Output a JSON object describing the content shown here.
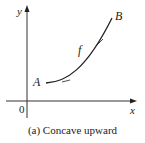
{
  "figure": {
    "caption": "(a) Concave upward",
    "axes": {
      "x_label": "x",
      "y_label": "y",
      "origin_label": "0"
    },
    "curve": {
      "name": "f",
      "start_point_label": "A",
      "end_point_label": "B",
      "concavity": "upward"
    },
    "colors": {
      "stroke": "#222222",
      "background": "#ffffff"
    }
  }
}
